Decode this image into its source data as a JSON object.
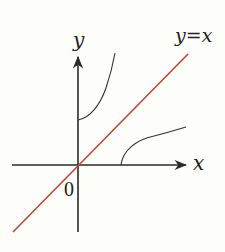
{
  "diagram": {
    "labels": {
      "y_axis": "y",
      "x_axis": "x",
      "origin": "0",
      "line": "y=x"
    },
    "colors": {
      "axes": "#2a2a2a",
      "curves": "#333333",
      "line": "#c0453a",
      "background": "#fdfdf9"
    }
  }
}
